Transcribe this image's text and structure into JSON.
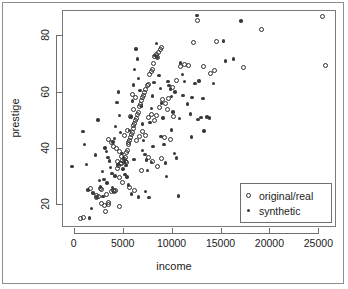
{
  "chart_data": {
    "type": "scatter",
    "title": "",
    "xlabel": "income",
    "ylabel": "prestige",
    "xlim": [
      -1200,
      26800
    ],
    "ylim": [
      12,
      89
    ],
    "xticks": [
      0,
      5000,
      10000,
      15000,
      20000,
      25000
    ],
    "yticks": [
      20,
      40,
      60,
      80
    ],
    "xtick_labels": [
      "0",
      "5000",
      "10000",
      "15000",
      "20000",
      "25000"
    ],
    "ytick_labels": [
      "20",
      "40",
      "60",
      "80"
    ],
    "grid": false,
    "legend_position": "bottom-right",
    "series": [
      {
        "name": "original/real",
        "marker": "open-circle",
        "color": "#2e2e2e",
        "points": [
          [
            611,
            15.3
          ],
          [
            896,
            15.8
          ],
          [
            1656,
            25.9
          ],
          [
            2216,
            23.5
          ],
          [
            2200,
            22.7
          ],
          [
            2448,
            23.3
          ],
          [
            2661,
            26.1
          ],
          [
            2766,
            20.6
          ],
          [
            3073,
            20.1
          ],
          [
            3116,
            18.0
          ],
          [
            3446,
            21.0
          ],
          [
            3485,
            20.2
          ],
          [
            3730,
            25.1
          ],
          [
            3930,
            25.4
          ],
          [
            4051,
            24.9
          ],
          [
            4168,
            25.3
          ],
          [
            4325,
            33.2
          ],
          [
            4414,
            35.6
          ],
          [
            4512,
            34.1
          ],
          [
            4564,
            29.9
          ],
          [
            4696,
            34.8
          ],
          [
            4741,
            34.9
          ],
          [
            4866,
            28.2
          ],
          [
            4921,
            36.0
          ],
          [
            5052,
            36.2
          ],
          [
            5139,
            35.7
          ],
          [
            5180,
            37.1
          ],
          [
            5268,
            35.2
          ],
          [
            5316,
            38.8
          ],
          [
            5381,
            39.5
          ],
          [
            5458,
            42.3
          ],
          [
            5536,
            41.5
          ],
          [
            5606,
            43.2
          ],
          [
            5688,
            44.1
          ],
          [
            5771,
            45.2
          ],
          [
            5860,
            46.0
          ],
          [
            5958,
            47.2
          ],
          [
            6042,
            48.5
          ],
          [
            6123,
            49.0
          ],
          [
            6202,
            50.2
          ],
          [
            6300,
            51.0
          ],
          [
            6411,
            52.3
          ],
          [
            6522,
            53.1
          ],
          [
            6645,
            55.2
          ],
          [
            6741,
            56.0
          ],
          [
            6852,
            57.4
          ],
          [
            6931,
            58.2
          ],
          [
            7012,
            59.1
          ],
          [
            7154,
            60.0
          ],
          [
            7263,
            61.2
          ],
          [
            7388,
            62.4
          ],
          [
            7512,
            63.0
          ],
          [
            7659,
            66.5
          ],
          [
            7801,
            67.7
          ],
          [
            7954,
            68.1
          ],
          [
            8080,
            70.2
          ],
          [
            8200,
            72.8
          ],
          [
            8322,
            73.5
          ],
          [
            8441,
            72.6
          ],
          [
            8563,
            74.1
          ],
          [
            8712,
            75.3
          ],
          [
            8832,
            76.0
          ],
          [
            3421,
            43.5
          ],
          [
            3760,
            42.3
          ],
          [
            4000,
            41.0
          ],
          [
            4290,
            40.2
          ],
          [
            4550,
            39.0
          ],
          [
            4800,
            37.5
          ],
          [
            5100,
            44.8
          ],
          [
            5400,
            46.5
          ],
          [
            5700,
            51.5
          ],
          [
            6000,
            53.9
          ],
          [
            6300,
            43.0
          ],
          [
            6600,
            44.3
          ],
          [
            6900,
            46.2
          ],
          [
            7200,
            45.0
          ],
          [
            7500,
            51.2
          ],
          [
            7800,
            52.1
          ],
          [
            8100,
            50.3
          ],
          [
            8400,
            51.8
          ],
          [
            8700,
            54.6
          ],
          [
            9000,
            57.5
          ],
          [
            9300,
            56.1
          ],
          [
            9600,
            58.0
          ],
          [
            10000,
            62.0
          ],
          [
            10400,
            64.5
          ],
          [
            10800,
            69.3
          ],
          [
            11200,
            70.1
          ],
          [
            11600,
            69.5
          ],
          [
            12100,
            78.0
          ],
          [
            12500,
            85.8
          ],
          [
            13200,
            69.3
          ],
          [
            13900,
            67.0
          ],
          [
            14300,
            67.8
          ],
          [
            14500,
            78.2
          ],
          [
            17200,
            68.8
          ],
          [
            19100,
            82.4
          ],
          [
            25300,
            87.2
          ],
          [
            25600,
            69.6
          ],
          [
            9800,
            43.5
          ],
          [
            9200,
            44.0
          ],
          [
            8900,
            36.5
          ],
          [
            8500,
            34.0
          ],
          [
            7900,
            35.5
          ],
          [
            7500,
            37.0
          ],
          [
            5600,
            26.5
          ],
          [
            6100,
            25.3
          ],
          [
            4600,
            19.8
          ],
          [
            3250,
            24.0
          ],
          [
            2700,
            25.8
          ],
          [
            6800,
            32.5
          ],
          [
            10100,
            51.5
          ],
          [
            9500,
            54.0
          ],
          [
            6250,
            58.3
          ],
          [
            5900,
            59.5
          ]
        ]
      },
      {
        "name": "synthetic",
        "marker": "filled-dot",
        "color": "#3a3a3a",
        "points": [
          [
            -300,
            33.8
          ],
          [
            840,
            46.3
          ],
          [
            980,
            41.7
          ],
          [
            1220,
            34.6
          ],
          [
            1500,
            15.6
          ],
          [
            1880,
            24.4
          ],
          [
            2100,
            37.9
          ],
          [
            2360,
            50.3
          ],
          [
            2500,
            28.9
          ],
          [
            2640,
            26.5
          ],
          [
            2820,
            32.0
          ],
          [
            2980,
            29.3
          ],
          [
            3100,
            40.4
          ],
          [
            3240,
            39.2
          ],
          [
            3390,
            37.0
          ],
          [
            3540,
            35.8
          ],
          [
            3660,
            33.5
          ],
          [
            3790,
            31.4
          ],
          [
            3920,
            42.5
          ],
          [
            4050,
            43.7
          ],
          [
            4190,
            48.0
          ],
          [
            4310,
            56.6
          ],
          [
            4440,
            60.2
          ],
          [
            4580,
            52.0
          ],
          [
            4700,
            45.8
          ],
          [
            4830,
            38.4
          ],
          [
            4960,
            36.9
          ],
          [
            5090,
            35.4
          ],
          [
            5220,
            34.2
          ],
          [
            5350,
            30.1
          ],
          [
            5480,
            27.2
          ],
          [
            5610,
            46.6
          ],
          [
            5740,
            51.4
          ],
          [
            5870,
            57.1
          ],
          [
            6000,
            62.8
          ],
          [
            6130,
            68.3
          ],
          [
            6260,
            75.5
          ],
          [
            6400,
            72.0
          ],
          [
            6530,
            65.1
          ],
          [
            6660,
            60.7
          ],
          [
            6790,
            55.3
          ],
          [
            6920,
            48.9
          ],
          [
            7050,
            43.1
          ],
          [
            7180,
            38.1
          ],
          [
            7310,
            36.2
          ],
          [
            7440,
            32.4
          ],
          [
            7570,
            22.8
          ],
          [
            7700,
            49.5
          ],
          [
            7830,
            54.4
          ],
          [
            7960,
            58.9
          ],
          [
            8090,
            63.7
          ],
          [
            8220,
            73.3
          ],
          [
            8350,
            77.5
          ],
          [
            8480,
            72.5
          ],
          [
            8610,
            66.2
          ],
          [
            8740,
            61.5
          ],
          [
            8870,
            56.4
          ],
          [
            9000,
            51.1
          ],
          [
            9130,
            41.7
          ],
          [
            9260,
            35.0
          ],
          [
            9390,
            30.2
          ],
          [
            9520,
            64.0
          ],
          [
            9650,
            62.5
          ],
          [
            9780,
            61.3
          ],
          [
            9910,
            58.6
          ],
          [
            10050,
            53.2
          ],
          [
            10200,
            38.5
          ],
          [
            10400,
            36.8
          ],
          [
            10600,
            23.4
          ],
          [
            10800,
            70.6
          ],
          [
            11000,
            66.5
          ],
          [
            11200,
            63.9
          ],
          [
            11500,
            56.0
          ],
          [
            11800,
            52.4
          ],
          [
            12000,
            58.4
          ],
          [
            12300,
            63.2
          ],
          [
            12500,
            87.5
          ],
          [
            12600,
            50.6
          ],
          [
            12900,
            51.2
          ],
          [
            13200,
            46.4
          ],
          [
            13500,
            51.4
          ],
          [
            13800,
            51.0
          ],
          [
            14200,
            63.2
          ],
          [
            15200,
            78.4
          ],
          [
            15400,
            71.3
          ],
          [
            16200,
            72.0
          ],
          [
            17000,
            85.5
          ],
          [
            11900,
            44.3
          ],
          [
            10700,
            50.8
          ],
          [
            9900,
            46.8
          ],
          [
            8800,
            44.5
          ],
          [
            8000,
            41.0
          ],
          [
            7200,
            25.0
          ],
          [
            6500,
            23.0
          ],
          [
            5800,
            24.1
          ],
          [
            5150,
            31.0
          ],
          [
            4400,
            34.5
          ],
          [
            3850,
            26.3
          ],
          [
            3300,
            28.0
          ],
          [
            2900,
            23.2
          ],
          [
            2250,
            22.9
          ],
          [
            1700,
            19.0
          ],
          [
            1350,
            25.5
          ],
          [
            4100,
            30.5
          ],
          [
            4950,
            33.0
          ],
          [
            6050,
            36.4
          ],
          [
            6950,
            39.6
          ],
          [
            7850,
            35.2
          ],
          [
            10250,
            60.2
          ],
          [
            11050,
            59.0
          ],
          [
            12700,
            64.1
          ],
          [
            13100,
            58.0
          ]
        ]
      }
    ]
  },
  "legend": {
    "items": [
      {
        "label": "original/real",
        "symbol": "open-circle"
      },
      {
        "label": "synthetic",
        "symbol": "filled-dot"
      }
    ]
  }
}
